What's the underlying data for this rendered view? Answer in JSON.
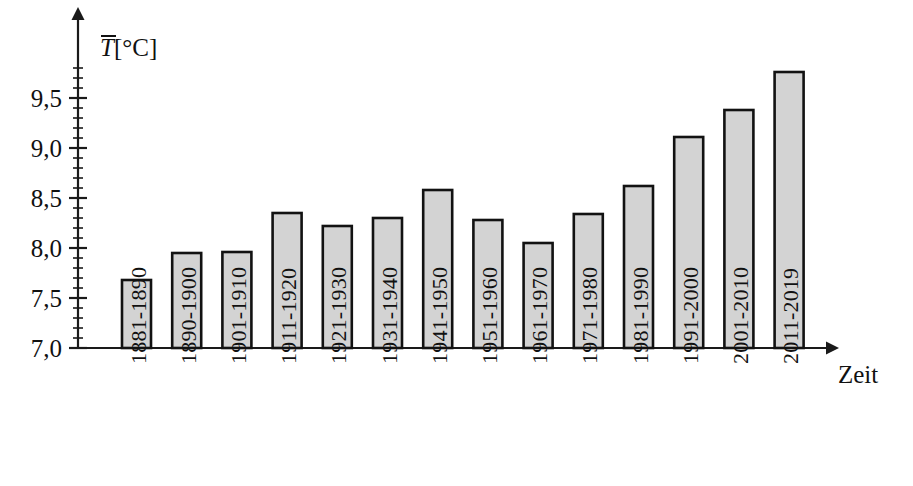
{
  "chart_data": {
    "type": "bar",
    "title": "",
    "subtitle": "",
    "xlabel": "Zeit",
    "ylabel": "T̄[°C]",
    "ylabel_symbol": "T",
    "ylabel_unit": "[°C]",
    "ylabel_has_overbar": true,
    "categories": [
      "1881-1890",
      "1890-1900",
      "1901-1910",
      "1911-1920",
      "1921-1930",
      "1931-1940",
      "1941-1950",
      "1951-1960",
      "1961-1970",
      "1971-1980",
      "1981-1990",
      "1991-2000",
      "2001-2010",
      "2011-2019"
    ],
    "values": [
      7.68,
      7.95,
      7.96,
      8.35,
      8.22,
      8.3,
      8.58,
      8.28,
      8.05,
      8.34,
      8.62,
      9.11,
      9.38,
      9.76
    ],
    "ylim": [
      7.0,
      9.8
    ],
    "ytick_labels": [
      "7,0",
      "7,5",
      "8,0",
      "8,5",
      "9,0",
      "9,5"
    ],
    "ytick_values": [
      7.0,
      7.5,
      8.0,
      8.5,
      9.0,
      9.5
    ],
    "yminor_step": 0.1,
    "grid": false,
    "legend": null,
    "bar_fill_color": "#d3d3d3",
    "bar_border_color": "#121212",
    "axis_color": "#1a1a1a",
    "x_axis_has_arrow": true,
    "y_axis_has_arrow": true,
    "decimal_separator": ","
  }
}
